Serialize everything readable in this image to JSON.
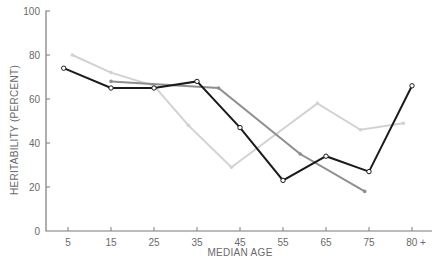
{
  "chart_data": {
    "type": "line",
    "title": "",
    "xlabel": "MEDIAN AGE",
    "ylabel": "HERITABILITY (PERCENT)",
    "ylim": [
      0,
      100
    ],
    "yticks": [
      0,
      20,
      40,
      60,
      80,
      100
    ],
    "xticks": [
      {
        "label": "5",
        "value": 5
      },
      {
        "label": "15",
        "value": 15
      },
      {
        "label": "25",
        "value": 25
      },
      {
        "label": "35",
        "value": 35
      },
      {
        "label": "45",
        "value": 45
      },
      {
        "label": "55",
        "value": 55
      },
      {
        "label": "65",
        "value": 65
      },
      {
        "label": "75",
        "value": 75
      },
      {
        "label": "80 +",
        "value": 85
      }
    ],
    "grid": false,
    "legend": null,
    "series": [
      {
        "name": "light-gray-series",
        "color": "#d2d2d2",
        "marker": "dot",
        "points": [
          [
            6,
            80
          ],
          [
            15,
            72
          ],
          [
            25,
            66
          ],
          [
            33,
            48
          ],
          [
            43,
            29
          ],
          [
            63,
            58
          ],
          [
            73,
            46
          ],
          [
            83,
            49
          ]
        ]
      },
      {
        "name": "medium-gray-series",
        "color": "#8e8e8e",
        "marker": "dot",
        "points": [
          [
            15,
            68
          ],
          [
            40,
            65
          ],
          [
            59,
            35
          ],
          [
            74,
            18
          ]
        ]
      },
      {
        "name": "black-series",
        "color": "#1a1a1a",
        "marker": "open-circle",
        "points": [
          [
            4,
            74
          ],
          [
            15,
            65
          ],
          [
            25,
            65
          ],
          [
            35,
            68
          ],
          [
            45,
            47
          ],
          [
            55,
            23
          ],
          [
            65,
            34
          ],
          [
            75,
            27
          ],
          [
            85,
            66
          ]
        ]
      }
    ]
  },
  "axes": {
    "x_title": "MEDIAN AGE",
    "y_title": "HERITABILITY (PERCENT)"
  }
}
